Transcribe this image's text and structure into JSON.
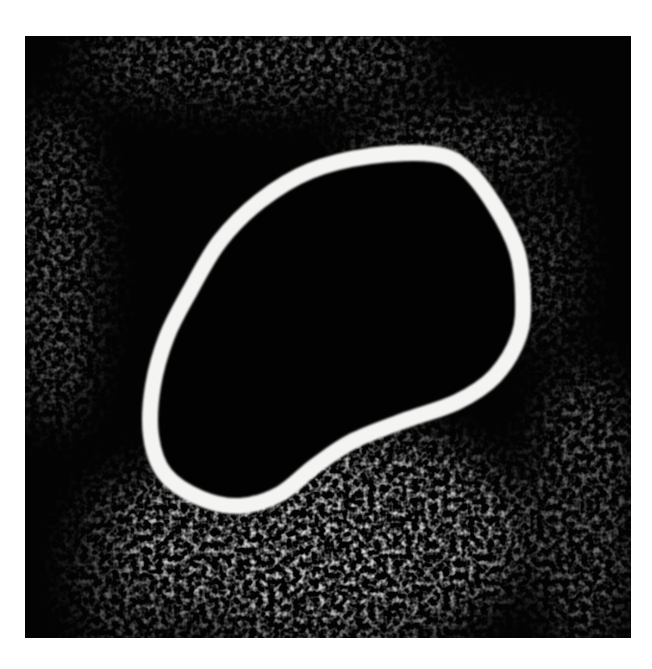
{
  "image": {
    "kind": "fluorescence microscopy (grayscale)",
    "subject": "cell with segmented nucleus",
    "background_color": "#ffffff",
    "field_color": "#030303",
    "contour_color": "#f4f4f2",
    "frame": {
      "x": 25,
      "y": 36,
      "width": 606,
      "height": 602
    },
    "contour": {
      "label": "nucleus segmentation outline",
      "stroke_width": 16,
      "points": [
        [
          345,
          120
        ],
        [
          408,
          118
        ],
        [
          440,
          132
        ],
        [
          470,
          170
        ],
        [
          492,
          215
        ],
        [
          498,
          260
        ],
        [
          494,
          300
        ],
        [
          470,
          340
        ],
        [
          432,
          366
        ],
        [
          378,
          385
        ],
        [
          328,
          405
        ],
        [
          290,
          430
        ],
        [
          255,
          458
        ],
        [
          215,
          470
        ],
        [
          175,
          462
        ],
        [
          140,
          438
        ],
        [
          126,
          400
        ],
        [
          128,
          350
        ],
        [
          142,
          300
        ],
        [
          165,
          255
        ],
        [
          195,
          205
        ],
        [
          235,
          165
        ],
        [
          285,
          135
        ]
      ]
    },
    "bright_regions": [
      {
        "name": "cytoplasm-lower",
        "cx": 300,
        "cy": 500,
        "rx": 200,
        "ry": 110,
        "opacity": 0.75
      },
      {
        "name": "cytoplasm-core",
        "cx": 300,
        "cy": 500,
        "rx": 90,
        "ry": 60,
        "opacity": 0.55
      },
      {
        "name": "left-strip",
        "cx": 30,
        "cy": 230,
        "rx": 40,
        "ry": 160,
        "opacity": 0.45
      },
      {
        "name": "top-band",
        "cx": 230,
        "cy": 25,
        "rx": 180,
        "ry": 40,
        "opacity": 0.45
      },
      {
        "name": "top-right-band",
        "cx": 430,
        "cy": 110,
        "rx": 110,
        "ry": 35,
        "opacity": 0.4
      },
      {
        "name": "right-of-contour",
        "cx": 520,
        "cy": 230,
        "rx": 30,
        "ry": 80,
        "opacity": 0.35
      },
      {
        "name": "lower-right-strip",
        "cx": 560,
        "cy": 470,
        "rx": 50,
        "ry": 140,
        "opacity": 0.45
      },
      {
        "name": "lower-left",
        "cx": 110,
        "cy": 530,
        "rx": 60,
        "ry": 90,
        "opacity": 0.4
      }
    ]
  }
}
